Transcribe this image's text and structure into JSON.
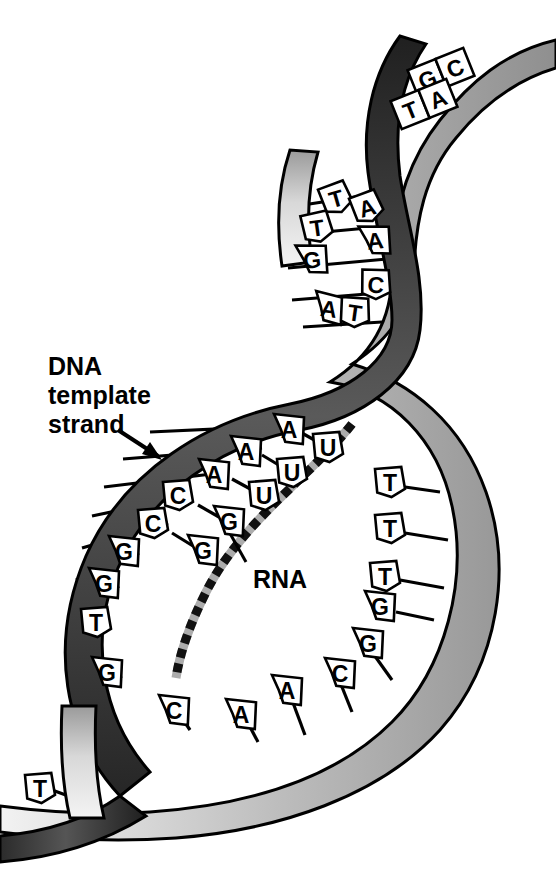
{
  "figure": {
    "labels": [
      {
        "id": "dna-template-strand",
        "lines": [
          "DNA",
          "template",
          "strand"
        ],
        "x": 48,
        "y": 375
      },
      {
        "id": "rna",
        "text": "RNA",
        "x": 253,
        "y": 578
      }
    ],
    "colors": {
      "ink": "#000000",
      "template_strand_dark": "#3a3a3a",
      "coding_strand_light": "#c9c9c9",
      "background": "#ffffff",
      "rna_strand": "#1a1a1a"
    }
  },
  "top_segment": {
    "name": "upper-helix-end",
    "pairs": [
      {
        "left": "G",
        "right": "C",
        "x": 441,
        "y": 73,
        "rot": -22
      },
      {
        "left": "T",
        "right": "A",
        "x": 424,
        "y": 104,
        "rot": -22
      }
    ]
  },
  "upper_bubble": {
    "name": "upper-open-region",
    "bases": [
      {
        "letter": "T",
        "x": 336,
        "y": 198,
        "shape": "pent",
        "rot": -16,
        "strand": "template"
      },
      {
        "letter": "A",
        "x": 367,
        "y": 207,
        "shape": "pent",
        "rot": -16,
        "strand": "coding"
      },
      {
        "letter": "T",
        "x": 317,
        "y": 227,
        "shape": "pent",
        "rot": -8,
        "strand": "template"
      },
      {
        "letter": "A",
        "x": 375,
        "y": 240,
        "shape": "arrow",
        "rot": -6,
        "strand": "coding"
      },
      {
        "letter": "G",
        "x": 312,
        "y": 259,
        "shape": "arrow",
        "rot": -6,
        "strand": "template"
      },
      {
        "letter": "C",
        "x": 376,
        "y": 284,
        "shape": "pent",
        "rot": 6,
        "strand": "coding"
      },
      {
        "letter": "A",
        "x": 329,
        "y": 308,
        "shape": "arrow",
        "rot": 8,
        "strand": "template"
      },
      {
        "letter": "T",
        "x": 355,
        "y": 312,
        "shape": "pent",
        "rot": 8,
        "strand": "coding"
      }
    ]
  },
  "transcription_bubble": {
    "name": "transcription-bubble",
    "template_bases": [
      {
        "letter": "A",
        "x": 289,
        "y": 429,
        "shape": "arrow"
      },
      {
        "letter": "A",
        "x": 246,
        "y": 451,
        "shape": "arrow"
      },
      {
        "letter": "A",
        "x": 214,
        "y": 474,
        "shape": "arrow"
      },
      {
        "letter": "C",
        "x": 178,
        "y": 495,
        "shape": "pent"
      },
      {
        "letter": "C",
        "x": 153,
        "y": 523,
        "shape": "pent"
      },
      {
        "letter": "G",
        "x": 124,
        "y": 551,
        "shape": "arrow"
      },
      {
        "letter": "G",
        "x": 104,
        "y": 583,
        "shape": "arrow"
      },
      {
        "letter": "T",
        "x": 96,
        "y": 622,
        "shape": "pent"
      },
      {
        "letter": "G",
        "x": 107,
        "y": 672,
        "shape": "arrow"
      },
      {
        "letter": "C",
        "x": 174,
        "y": 710,
        "shape": "arrow"
      },
      {
        "letter": "A",
        "x": 241,
        "y": 714,
        "shape": "arrow"
      },
      {
        "letter": "A",
        "x": 287,
        "y": 690,
        "shape": "arrow"
      },
      {
        "letter": "C",
        "x": 340,
        "y": 673,
        "shape": "arrow"
      },
      {
        "letter": "G",
        "x": 368,
        "y": 643,
        "shape": "arrow"
      }
    ],
    "coding_bases": [
      {
        "letter": "T",
        "x": 390,
        "y": 482,
        "shape": "pent"
      },
      {
        "letter": "T",
        "x": 390,
        "y": 528,
        "shape": "pent"
      },
      {
        "letter": "T",
        "x": 385,
        "y": 576,
        "shape": "pent"
      },
      {
        "letter": "G",
        "x": 380,
        "y": 606,
        "shape": "arrow"
      }
    ],
    "rna_bases": [
      {
        "letter": "U",
        "x": 328,
        "y": 447,
        "shape": "pent"
      },
      {
        "letter": "U",
        "x": 292,
        "y": 472,
        "shape": "pent"
      },
      {
        "letter": "U",
        "x": 264,
        "y": 495,
        "shape": "pent"
      },
      {
        "letter": "G",
        "x": 229,
        "y": 521,
        "shape": "arrow"
      },
      {
        "letter": "G",
        "x": 203,
        "y": 550,
        "shape": "arrow"
      }
    ]
  },
  "bottom_segment": {
    "name": "lower-helix-end",
    "bases": [
      {
        "letter": "T",
        "x": 40,
        "y": 788,
        "shape": "pent"
      }
    ]
  }
}
